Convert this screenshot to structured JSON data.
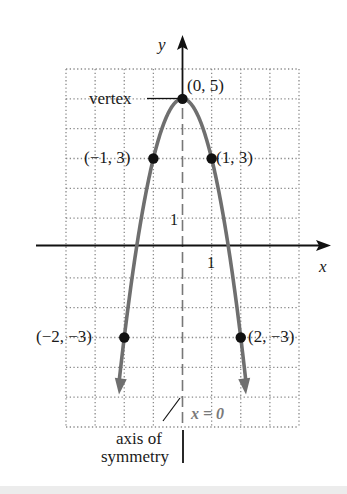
{
  "chart_data": {
    "type": "line",
    "title": "",
    "function": "y = 5 - 2x^2",
    "xlabel": "x",
    "ylabel": "y",
    "xlim": [
      -4,
      4
    ],
    "ylim": [
      -6,
      6
    ],
    "grid": true,
    "grid_style": "dotted",
    "tick_labels": {
      "x": "1",
      "y": "1"
    },
    "points": [
      {
        "x": 0,
        "y": 5,
        "label": "(0, 5)"
      },
      {
        "x": -1,
        "y": 3,
        "label": "(−1, 3)"
      },
      {
        "x": 1,
        "y": 3,
        "label": "(1, 3)"
      },
      {
        "x": -2,
        "y": -3,
        "label": "(−2, −3)"
      },
      {
        "x": 2,
        "y": -3,
        "label": "(2, −3)"
      }
    ],
    "annotations": {
      "vertex": "vertex",
      "axis_of_symmetry_line1": "axis of",
      "axis_of_symmetry_line2": "symmetry",
      "axis_equation": "x = 0"
    },
    "colors": {
      "curve": "#6f6f6f",
      "points": "#111111",
      "grid": "#8a8a8a",
      "axes": "#111111",
      "symmetry_line": "#777777",
      "equation_text": "#7a7a7a"
    }
  }
}
